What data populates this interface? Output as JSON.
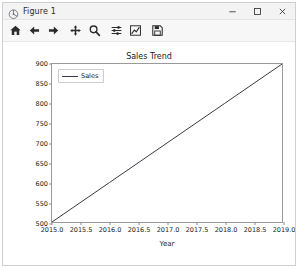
{
  "window": {
    "title": "Figure 1",
    "title_icon": "matplotlib-figure-icon",
    "minimize_label": "–",
    "maximize_label": "□",
    "close_label": "✕"
  },
  "toolbar": {
    "buttons": [
      {
        "name": "home-icon",
        "tooltip": "Reset original view"
      },
      {
        "name": "back-arrow-icon",
        "tooltip": "Back to previous view"
      },
      {
        "name": "forward-arrow-icon",
        "tooltip": "Forward to next view"
      },
      {
        "name": "pan-move-icon",
        "tooltip": "Pan axes with left mouse, zoom with right"
      },
      {
        "name": "zoom-magnifier-icon",
        "tooltip": "Zoom to rectangle"
      },
      {
        "name": "configure-subplots-icon",
        "tooltip": "Configure subplots"
      },
      {
        "name": "edit-axis-curve-icon",
        "tooltip": "Edit axis, curve and image parameters"
      },
      {
        "name": "save-floppy-icon",
        "tooltip": "Save the figure"
      }
    ]
  },
  "chart_data": {
    "type": "line",
    "title": "Sales Trend",
    "xlabel": "Year",
    "ylabel": "",
    "xlim": [
      2015.0,
      2019.0
    ],
    "ylim": [
      500,
      900
    ],
    "grid": false,
    "legend_position": "upper left",
    "xticks": [
      "2015.0",
      "2015.5",
      "2016.0",
      "2016.5",
      "2017.0",
      "2017.5",
      "2018.0",
      "2018.5",
      "2019.0"
    ],
    "xtick_values": [
      2015.0,
      2015.5,
      2016.0,
      2016.5,
      2017.0,
      2017.5,
      2018.0,
      2018.5,
      2019.0
    ],
    "yticks": [
      "500",
      "550",
      "600",
      "650",
      "700",
      "750",
      "800",
      "850",
      "900"
    ],
    "ytick_values": [
      500,
      550,
      600,
      650,
      700,
      750,
      800,
      850,
      900
    ],
    "series": [
      {
        "name": "Sales",
        "color": "#3a3a46",
        "x": [
          2015,
          2016,
          2017,
          2018,
          2019
        ],
        "values": [
          500,
          600,
          700,
          800,
          900
        ]
      }
    ]
  },
  "colors": {
    "line": "#3a3a46",
    "axes_border": "#9a9a9a",
    "titlebar": "#f3f3f3",
    "toolbar": "#f7f7f7",
    "window_border": "#cfcfcf"
  }
}
